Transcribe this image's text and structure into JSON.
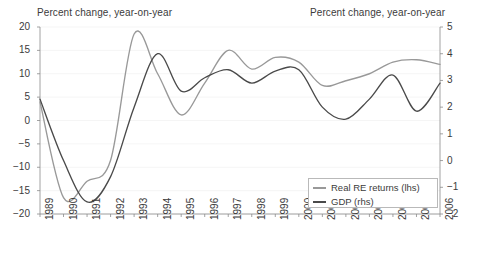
{
  "chart_data": {
    "type": "line",
    "title": "",
    "title_left": "Percent change, year-on-year",
    "title_right": "Percent change, year-on-year",
    "xlabel": "",
    "ylabel": "",
    "grid": true,
    "legend_position": "bottom-right",
    "x": [
      1989,
      1990,
      1991,
      1992,
      1993,
      1994,
      1995,
      1996,
      1997,
      1998,
      1999,
      2000,
      2001,
      2002,
      2003,
      2004,
      2005,
      2006
    ],
    "xtick_labels": [
      "1989",
      "1990",
      "1991",
      "1992",
      "1993",
      "1994",
      "1995",
      "1996",
      "1997",
      "1998",
      "1999",
      "2000",
      "2001",
      "2002",
      "2003",
      "2004",
      "2005",
      "2006"
    ],
    "left_axis": {
      "label": "Percent change, year-on-year",
      "ticks": [
        20,
        15,
        10,
        5,
        0,
        -5,
        -10,
        -15,
        -20
      ],
      "tick_labels": [
        "20",
        "15",
        "10",
        "5",
        "0",
        "−5",
        "−10",
        "−15",
        "−20"
      ],
      "ylim": [
        -20,
        20
      ]
    },
    "right_axis": {
      "label": "Percent change, year-on-year",
      "ticks": [
        5,
        4,
        3,
        2,
        1,
        0,
        -1,
        -2
      ],
      "tick_labels": [
        "5",
        "4",
        "3",
        "2",
        "1",
        "0",
        "−1",
        "−2"
      ],
      "ylim": [
        -2,
        5
      ]
    },
    "series": [
      {
        "name": "Real RE returns (lhs)",
        "axis": "left",
        "color": "#999999",
        "values": [
          4.0,
          -16.5,
          -13.0,
          -8.5,
          18.5,
          10.0,
          1.2,
          8.0,
          15.0,
          11.0,
          13.5,
          12.5,
          7.5,
          8.5,
          10.0,
          12.5,
          13.0,
          12.0
        ]
      },
      {
        "name": "GDP (rhs)",
        "axis": "right",
        "color": "#4a4a4a",
        "values": [
          2.3,
          0.0,
          -1.55,
          -0.6,
          2.0,
          4.0,
          2.6,
          3.1,
          3.4,
          2.9,
          3.35,
          3.4,
          2.0,
          1.55,
          2.3,
          3.2,
          1.85,
          2.9
        ]
      }
    ],
    "legend": [
      {
        "label": "Real RE returns (lhs)",
        "color": "#999999"
      },
      {
        "label": "GDP (rhs)",
        "color": "#4a4a4a"
      }
    ]
  }
}
